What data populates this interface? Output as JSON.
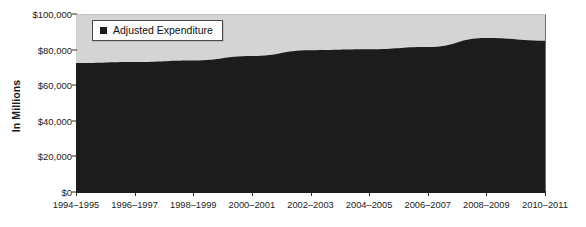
{
  "chart_data": {
    "type": "area",
    "title": "",
    "xlabel": "",
    "ylabel": "In Millions",
    "legend": [
      {
        "label": "Adjusted Expenditure",
        "color": "#1c1c1c"
      }
    ],
    "legend_position": "top-left",
    "grid": false,
    "plot_background": "#d4d4d4",
    "ylim": [
      0,
      100000
    ],
    "yticks": [
      0,
      20000,
      40000,
      60000,
      80000,
      100000
    ],
    "ytick_labels": [
      "$0",
      "$20,000",
      "$40,000",
      "$60,000",
      "$80,000",
      "$100,000"
    ],
    "categories": [
      "1994–1995",
      "1996–1997",
      "1998–1999",
      "2000–2001",
      "2002–2003",
      "2004–2005",
      "2006–2007",
      "2008–2009",
      "2010–2011"
    ],
    "series": [
      {
        "name": "Adjusted Expenditure",
        "color": "#1c1c1c",
        "values": [
          73000,
          73600,
          74500,
          77000,
          80200,
          80700,
          82000,
          87100,
          85500
        ]
      }
    ]
  }
}
